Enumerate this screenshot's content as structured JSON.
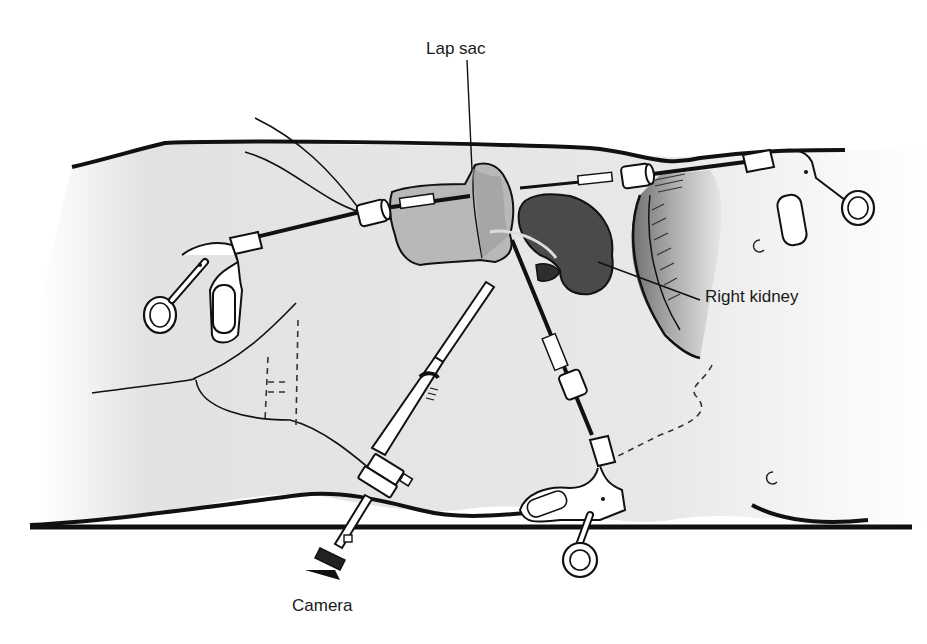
{
  "figure": {
    "labels": {
      "lap_sac": "Lap sac",
      "right_kidney": "Right kidney",
      "camera": "Camera"
    }
  },
  "colors": {
    "outline": "#111111",
    "kidney_fill": "#4a4a4a",
    "sac_fill": "#b8b8b8",
    "skin_fill": "#e6e6e6",
    "liver_shade": "#9a9a9a",
    "instrument_fill": "#ffffff"
  }
}
